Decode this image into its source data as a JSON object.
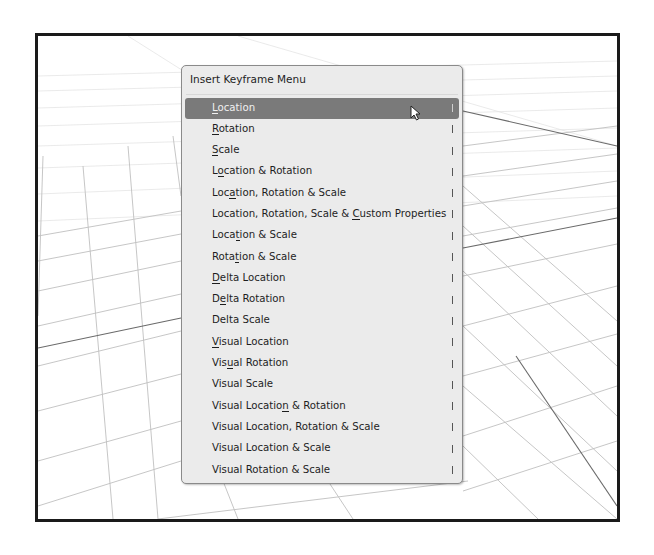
{
  "menu": {
    "title": "Insert Keyframe Menu",
    "active_index": 0,
    "items": [
      {
        "label": "Location",
        "underline": 0
      },
      {
        "label": "Rotation",
        "underline": 0
      },
      {
        "label": "Scale",
        "underline": 0
      },
      {
        "label": "Location & Rotation",
        "underline": 1
      },
      {
        "label": "Location, Rotation & Scale",
        "underline": 3
      },
      {
        "label": "Location, Rotation, Scale & Custom Properties",
        "underline": 28
      },
      {
        "label": "Location & Scale",
        "underline": 4
      },
      {
        "label": "Rotation & Scale",
        "underline": 4
      },
      {
        "label": "Delta Location",
        "underline": 0
      },
      {
        "label": "Delta Rotation",
        "underline": 1
      },
      {
        "label": "Delta Scale",
        "underline": -1
      },
      {
        "label": "Visual Location",
        "underline": 0
      },
      {
        "label": "Visual Rotation",
        "underline": 3
      },
      {
        "label": "Visual Scale",
        "underline": -1
      },
      {
        "label": "Visual Location & Rotation",
        "underline": 14
      },
      {
        "label": "Visual Location, Rotation & Scale",
        "underline": -1
      },
      {
        "label": "Visual Location & Scale",
        "underline": -1
      },
      {
        "label": "Visual Rotation & Scale",
        "underline": -1
      }
    ]
  },
  "cursor": {
    "icon": "arrow-pointer-icon"
  },
  "colors": {
    "menu_bg": "#ebebeb",
    "highlight": "#7a7a7a",
    "frame_border": "#1a1a1a",
    "grid_line": "#bdbdbd"
  }
}
